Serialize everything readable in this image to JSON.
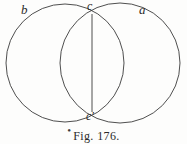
{
  "figure": {
    "caption_mark": "•",
    "caption": "Fig. 176.",
    "background_color": "#fdfdfc",
    "ink_color": "#3b3b3b",
    "labels": {
      "right_circle": "a",
      "left_circle": "b",
      "top_intersection": "c",
      "bottom_intersection": "c'"
    },
    "geometry": {
      "left_circle": {
        "cx": 65,
        "cy": 63,
        "r": 59
      },
      "right_circle": {
        "cx": 120,
        "cy": 63,
        "r": 60
      },
      "chord": {
        "x1": 92,
        "y1": 14,
        "x2": 92,
        "y2": 112
      }
    }
  }
}
